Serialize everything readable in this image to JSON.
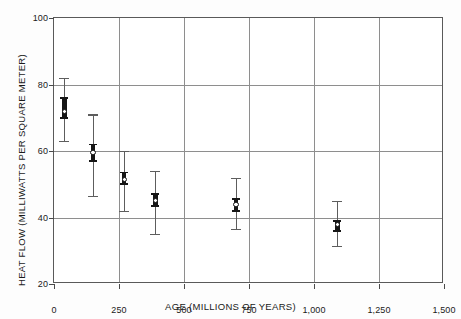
{
  "chart_data": {
    "type": "scatter",
    "title": "",
    "xlabel": "AGE (MILLIONS OF YEARS)",
    "ylabel": "HEAT FLOW (MILLIWATTS PER SQUARE METER)",
    "xlim": [
      0,
      1500
    ],
    "ylim": [
      20,
      100
    ],
    "grid": true,
    "legend": "none",
    "xticks": [
      0,
      250,
      500,
      750,
      1000,
      1250,
      1500
    ],
    "xtick_labels": [
      "0",
      "250",
      "500",
      "750",
      "1,000",
      "1,250",
      "1,500"
    ],
    "yticks": [
      20,
      40,
      60,
      80,
      100
    ],
    "ytick_labels": [
      "20",
      "40",
      "60",
      "80",
      "100"
    ],
    "marker_style": "open-circle-with-error-bars",
    "series": [
      {
        "name": "Mean heat flow by age group",
        "points": [
          {
            "label": "point-1",
            "age": 40,
            "heat_flow": 72.0,
            "se_low": 70.0,
            "se_high": 76.0,
            "range_low": 63.0,
            "range_high": 82.0
          },
          {
            "label": "point-2",
            "age": 150,
            "heat_flow": 59.5,
            "se_low": 57.0,
            "se_high": 62.0,
            "range_low": 46.5,
            "range_high": 71.0
          },
          {
            "label": "point-3",
            "age": 270,
            "heat_flow": 51.5,
            "se_low": 50.0,
            "se_high": 53.5,
            "range_low": 42.0,
            "range_high": 60.0
          },
          {
            "label": "point-4",
            "age": 390,
            "heat_flow": 45.0,
            "se_low": 43.5,
            "se_high": 47.0,
            "range_low": 35.0,
            "range_high": 54.0
          },
          {
            "label": "point-5",
            "age": 700,
            "heat_flow": 44.0,
            "se_low": 42.0,
            "se_high": 45.5,
            "range_low": 36.5,
            "range_high": 52.0
          },
          {
            "label": "point-6",
            "age": 1090,
            "heat_flow": 38.0,
            "se_low": 36.0,
            "se_high": 39.0,
            "range_low": 31.5,
            "range_high": 45.0
          }
        ]
      }
    ]
  },
  "colors": {
    "background": "#ffffff",
    "frame": "#5a5a5a",
    "gridline": "#8e8e8e",
    "whisker": "#5d5d5d",
    "se_bar": "#161616",
    "marker_fill": "#ffffff",
    "text": "#1a1a1a"
  }
}
